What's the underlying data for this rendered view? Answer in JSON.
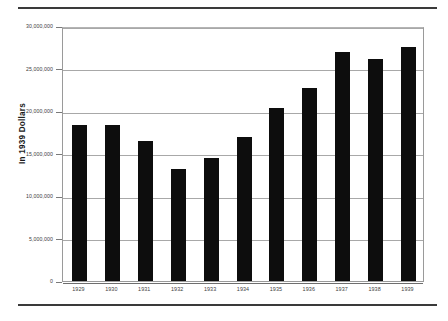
{
  "chart_data": {
    "type": "bar",
    "title": "",
    "xlabel": "",
    "ylabel": "In 1939 Dollars",
    "categories": [
      "1929",
      "1930",
      "1931",
      "1932",
      "1933",
      "1934",
      "1935",
      "1936",
      "1937",
      "1938",
      "1939"
    ],
    "values": [
      18300000,
      18300000,
      16500000,
      13200000,
      14500000,
      16900000,
      20400000,
      22700000,
      27000000,
      26100000,
      27500000
    ],
    "ylim": [
      0,
      30000000
    ],
    "y_ticks": [
      0,
      5000000,
      10000000,
      15000000,
      20000000,
      25000000,
      30000000
    ],
    "y_tick_labels": [
      "0",
      "5,000,000",
      "10,000,000",
      "15,000,000",
      "20,000,000",
      "25,000,000",
      "30,000,000"
    ],
    "grid": true,
    "legend": null,
    "bar_color": "#0d0d0d",
    "grid_color": "#a8a8a8",
    "axis_color": "#7a7a7a",
    "background": "#ffffff"
  },
  "figure": {
    "top_rule": "horizontal-rule",
    "bottom_rule": "horizontal-rule"
  }
}
